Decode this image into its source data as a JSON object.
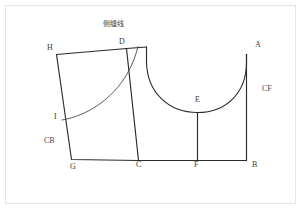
{
  "drawing": {
    "title_annotation": "侧缝线",
    "stroke_color": "#2b2b2b",
    "frame_color": "#e6e6e6",
    "background": "#ffffff",
    "points": [
      {
        "id": "H",
        "label": "H",
        "x": 53,
        "y": 49
      },
      {
        "id": "D",
        "label": "D",
        "x": 122,
        "y": 44
      },
      {
        "id": "A",
        "label": "A",
        "x": 258,
        "y": 46
      },
      {
        "id": "E",
        "label": "E",
        "x": 198,
        "y": 101
      },
      {
        "id": "I",
        "label": "I",
        "x": 58,
        "y": 117
      },
      {
        "id": "G",
        "label": "G",
        "x": 70,
        "y": 165
      },
      {
        "id": "C",
        "label": "C",
        "x": 138,
        "y": 165
      },
      {
        "id": "F",
        "label": "F",
        "x": 196,
        "y": 165
      },
      {
        "id": "B",
        "label": "B",
        "x": 254,
        "y": 165
      }
    ],
    "segment_labels": [
      {
        "id": "CB",
        "label": "CB",
        "x": 44,
        "y": 141
      },
      {
        "id": "CF",
        "label": "CF",
        "x": 264,
        "y": 89
      }
    ],
    "geometry": {
      "side_panel": "H-D-C-G quadrilateral",
      "bodice_front": "D-A-B-C outline with neckline U-curve",
      "neckline_low_point": "E",
      "center_drop_line": "E-F"
    }
  }
}
